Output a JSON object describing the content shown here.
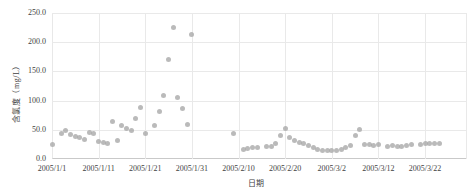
{
  "chart_data": {
    "type": "scatter",
    "title": "",
    "xlabel": "日期",
    "ylabel": "含氯度（mg/L）",
    "ylim": [
      0,
      250
    ],
    "x_span_days": 89,
    "grid": true,
    "legend": "none",
    "marker_color": "#a9a9a9",
    "grid_color": "#e9e9e9",
    "axis_color": "#c9c9c9",
    "tick_text_color": "#3f3f3f",
    "y_ticks": [
      {
        "label": "250.0",
        "value": 250
      },
      {
        "label": "200.0",
        "value": 200
      },
      {
        "label": "150.0",
        "value": 150
      },
      {
        "label": "100.0",
        "value": 100
      },
      {
        "label": "50.0",
        "value": 50
      },
      {
        "label": "0.0",
        "value": 0
      }
    ],
    "x_ticks": [
      {
        "label": "2005/1/1",
        "day": 0
      },
      {
        "label": "2005/1/11",
        "day": 10
      },
      {
        "label": "2005/1/21",
        "day": 20
      },
      {
        "label": "2005/1/31",
        "day": 30
      },
      {
        "label": "2005/2/10",
        "day": 40
      },
      {
        "label": "2005/2/20",
        "day": 50
      },
      {
        "label": "2005/3/2",
        "day": 60
      },
      {
        "label": "2005/3/12",
        "day": 70
      },
      {
        "label": "2005/3/22",
        "day": 80
      }
    ],
    "points": [
      {
        "date": "2005/1/1",
        "day": 0,
        "value": 24
      },
      {
        "date": "2005/1/3",
        "day": 2,
        "value": 44
      },
      {
        "date": "2005/1/4",
        "day": 3,
        "value": 48
      },
      {
        "date": "2005/1/5",
        "day": 4,
        "value": 42
      },
      {
        "date": "2005/1/6",
        "day": 5,
        "value": 39
      },
      {
        "date": "2005/1/7",
        "day": 6,
        "value": 37
      },
      {
        "date": "2005/1/8",
        "day": 7,
        "value": 33
      },
      {
        "date": "2005/1/9",
        "day": 8,
        "value": 46
      },
      {
        "date": "2005/1/10",
        "day": 9,
        "value": 43
      },
      {
        "date": "2005/1/11",
        "day": 10,
        "value": 30
      },
      {
        "date": "2005/1/12",
        "day": 11,
        "value": 28
      },
      {
        "date": "2005/1/13",
        "day": 12,
        "value": 26
      },
      {
        "date": "2005/1/14",
        "day": 13,
        "value": 64
      },
      {
        "date": "2005/1/15",
        "day": 14,
        "value": 31
      },
      {
        "date": "2005/1/16",
        "day": 15,
        "value": 57
      },
      {
        "date": "2005/1/17",
        "day": 16,
        "value": 53
      },
      {
        "date": "2005/1/18",
        "day": 17,
        "value": 49
      },
      {
        "date": "2005/1/19",
        "day": 18,
        "value": 70
      },
      {
        "date": "2005/1/20",
        "day": 19,
        "value": 88
      },
      {
        "date": "2005/1/21",
        "day": 20,
        "value": 43
      },
      {
        "date": "2005/1/23",
        "day": 22,
        "value": 58
      },
      {
        "date": "2005/1/24",
        "day": 23,
        "value": 82
      },
      {
        "date": "2005/1/25",
        "day": 24,
        "value": 108
      },
      {
        "date": "2005/1/26",
        "day": 25,
        "value": 170
      },
      {
        "date": "2005/1/27",
        "day": 26,
        "value": 226
      },
      {
        "date": "2005/1/28",
        "day": 27,
        "value": 105
      },
      {
        "date": "2005/1/29",
        "day": 28,
        "value": 86
      },
      {
        "date": "2005/1/30",
        "day": 29,
        "value": 59
      },
      {
        "date": "2005/1/31",
        "day": 30,
        "value": 214
      },
      {
        "date": "2005/2/9",
        "day": 39,
        "value": 43
      },
      {
        "date": "2005/2/11",
        "day": 41,
        "value": 16
      },
      {
        "date": "2005/2/12",
        "day": 42,
        "value": 18
      },
      {
        "date": "2005/2/13",
        "day": 43,
        "value": 19
      },
      {
        "date": "2005/2/14",
        "day": 44,
        "value": 20
      },
      {
        "date": "2005/2/16",
        "day": 46,
        "value": 21
      },
      {
        "date": "2005/2/17",
        "day": 47,
        "value": 22
      },
      {
        "date": "2005/2/18",
        "day": 48,
        "value": 26
      },
      {
        "date": "2005/2/19",
        "day": 49,
        "value": 40
      },
      {
        "date": "2005/2/20",
        "day": 50,
        "value": 52
      },
      {
        "date": "2005/2/21",
        "day": 51,
        "value": 37
      },
      {
        "date": "2005/2/22",
        "day": 52,
        "value": 31
      },
      {
        "date": "2005/2/23",
        "day": 53,
        "value": 29
      },
      {
        "date": "2005/2/24",
        "day": 54,
        "value": 26
      },
      {
        "date": "2005/2/25",
        "day": 55,
        "value": 23
      },
      {
        "date": "2005/2/26",
        "day": 56,
        "value": 20
      },
      {
        "date": "2005/2/27",
        "day": 57,
        "value": 17
      },
      {
        "date": "2005/2/28",
        "day": 58,
        "value": 15
      },
      {
        "date": "2005/3/1",
        "day": 59,
        "value": 14
      },
      {
        "date": "2005/3/2",
        "day": 60,
        "value": 14
      },
      {
        "date": "2005/3/3",
        "day": 61,
        "value": 15
      },
      {
        "date": "2005/3/4",
        "day": 62,
        "value": 17
      },
      {
        "date": "2005/3/5",
        "day": 63,
        "value": 19
      },
      {
        "date": "2005/3/6",
        "day": 64,
        "value": 23
      },
      {
        "date": "2005/3/7",
        "day": 65,
        "value": 40
      },
      {
        "date": "2005/3/8",
        "day": 66,
        "value": 50
      },
      {
        "date": "2005/3/9",
        "day": 67,
        "value": 25
      },
      {
        "date": "2005/3/10",
        "day": 68,
        "value": 24
      },
      {
        "date": "2005/3/11",
        "day": 69,
        "value": 23
      },
      {
        "date": "2005/3/12",
        "day": 70,
        "value": 25
      },
      {
        "date": "2005/3/14",
        "day": 72,
        "value": 22
      },
      {
        "date": "2005/3/15",
        "day": 73,
        "value": 23
      },
      {
        "date": "2005/3/16",
        "day": 74,
        "value": 22
      },
      {
        "date": "2005/3/17",
        "day": 75,
        "value": 21
      },
      {
        "date": "2005/3/18",
        "day": 76,
        "value": 23
      },
      {
        "date": "2005/3/19",
        "day": 77,
        "value": 24
      },
      {
        "date": "2005/3/21",
        "day": 79,
        "value": 25
      },
      {
        "date": "2005/3/22",
        "day": 80,
        "value": 26
      },
      {
        "date": "2005/3/23",
        "day": 81,
        "value": 27
      },
      {
        "date": "2005/3/24",
        "day": 82,
        "value": 26
      },
      {
        "date": "2005/3/25",
        "day": 83,
        "value": 27
      }
    ]
  }
}
